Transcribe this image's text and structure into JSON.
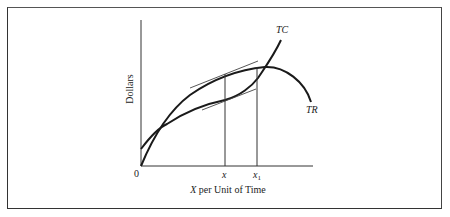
{
  "figure": {
    "y_axis_label": "Dollars",
    "x_axis_label_var": "X",
    "x_axis_label_rest": " per Unit of Time",
    "origin_label": "0",
    "x_tick_x": "x",
    "x_tick_x1_base": "x",
    "x_tick_x1_sub": "1",
    "curve_tc_label": "TC",
    "curve_tr_label": "TR",
    "colors": {
      "line": "#1a1a1a",
      "frame": "#444444",
      "background": "#ffffff"
    }
  },
  "diagram": {
    "type": "economics-cost-revenue",
    "curves": [
      {
        "name": "TC",
        "description": "Total cost: positive intercept, concave then convex, rising steeply"
      },
      {
        "name": "TR",
        "description": "Total revenue: from origin, concave, peaks then falls"
      }
    ],
    "markers": [
      {
        "label": "x",
        "description": "Output where slopes of TR and TC are equal (parallel tangents), max profit"
      },
      {
        "label": "x1",
        "description": "Output where TR is at its maximum"
      }
    ]
  }
}
